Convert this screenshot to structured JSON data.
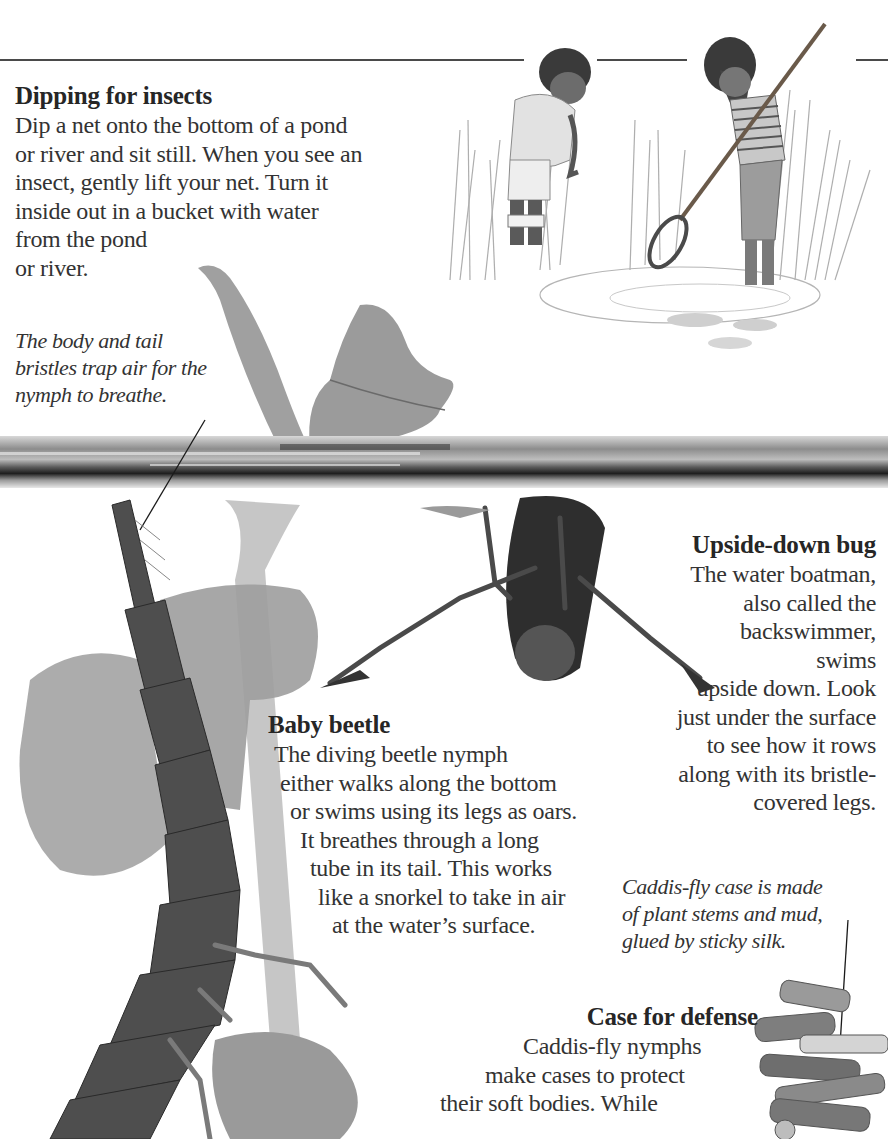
{
  "page": {
    "background": "#ffffff",
    "text_color": "#2a2a2a"
  },
  "sections": {
    "dipping": {
      "heading": "Dipping for insects",
      "lines": [
        "Dip a net onto the bottom of a pond",
        "or river and sit still. When you see an",
        "insect, gently lift your net. Turn it",
        "inside out in a bucket with water",
        "from the pond",
        "or river."
      ]
    },
    "nymph_caption": {
      "lines": [
        "The body and tail",
        "bristles trap air for the",
        "nymph to breathe."
      ]
    },
    "upside_down_bug": {
      "heading": "Upside-down bug",
      "lines": [
        "The water boatman,",
        "also called the",
        "backswimmer,",
        "swims",
        "upside down. Look",
        "just under the surface",
        "to see how it rows",
        "along with its bristle-",
        "covered legs."
      ]
    },
    "baby_beetle": {
      "heading": "Baby beetle",
      "lines": [
        "The diving beetle nymph",
        "either walks along the bottom",
        "or swims using its legs as oars.",
        "It breathes through a long",
        "tube in its tail. This works",
        "like a snorkel to take in air",
        "at the water’s surface."
      ]
    },
    "caddis_caption": {
      "lines": [
        "Caddis-fly case is made",
        "of plant stems and mud,",
        "glued by sticky silk."
      ]
    },
    "case_for_defense": {
      "heading": "Case for defense",
      "lines": [
        "Caddis-fly nymphs",
        "make cases to protect",
        "their soft bodies. While"
      ]
    }
  },
  "illustrations": [
    {
      "name": "children-pond-dipping",
      "description": "Pencil drawing of a boy and a girl with a net at the edge of a pond"
    },
    {
      "name": "floating-leaves",
      "description": "Leaves floating on water surface"
    },
    {
      "name": "water-surface",
      "description": "Horizontal band of water surface"
    },
    {
      "name": "diving-beetle-nymph",
      "description": "Segmented diving beetle larva hanging from the surface"
    },
    {
      "name": "water-boatman",
      "description": "Backswimmer upside down under the surface"
    },
    {
      "name": "caddis-fly-case",
      "description": "Case made of plant stems"
    }
  ]
}
